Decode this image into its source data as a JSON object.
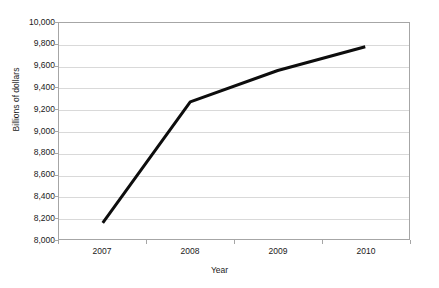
{
  "chart_data": {
    "type": "line",
    "title": "",
    "subtitle": "",
    "xlabel": "Year",
    "ylabel": "Billions of dollars",
    "categories": [
      "2007",
      "2008",
      "2009",
      "2010"
    ],
    "series": [
      {
        "name": "",
        "values": [
          8150,
          9270,
          9560,
          9780
        ],
        "color": "#0d0d0d",
        "line_width": 3,
        "markers": false
      }
    ],
    "ylim": [
      8000,
      10000
    ],
    "y_ticks": [
      8000,
      8200,
      8400,
      8600,
      8800,
      9000,
      9200,
      9400,
      9600,
      9800,
      10000
    ],
    "y_tick_labels": [
      "8,000",
      "8,200",
      "8,400",
      "8,600",
      "8,800",
      "9,000",
      "9,200",
      "9,400",
      "9,600",
      "9,800",
      "10,000"
    ],
    "x_tick_labels": [
      "2007",
      "2008",
      "2009",
      "2010"
    ],
    "grid": {
      "horizontal": true,
      "vertical": false,
      "color": "#d9d9d9"
    },
    "legend": {
      "visible": false,
      "position": "none",
      "entries": []
    },
    "plot_border_color": "#a6a6a6",
    "background_color": "#ffffff",
    "axis_type_x": "category"
  }
}
